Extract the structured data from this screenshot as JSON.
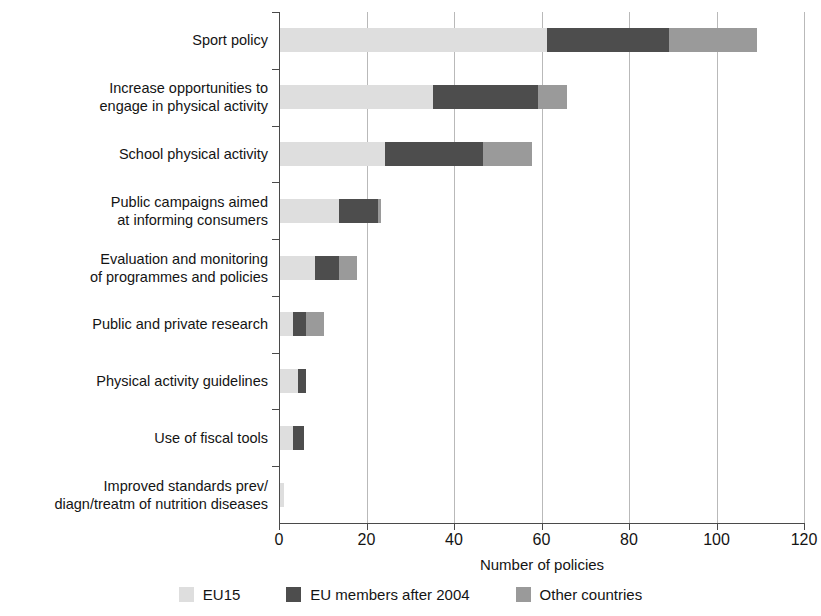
{
  "chart_data": {
    "type": "bar",
    "orientation": "horizontal",
    "stacked": true,
    "title": "",
    "xlabel": "Number of policies",
    "ylabel": "",
    "xlim": [
      0,
      120
    ],
    "xticks": [
      0,
      20,
      40,
      60,
      80,
      100,
      120
    ],
    "grid": "vertical",
    "legend_position": "bottom",
    "categories": [
      "Sport policy",
      "Increase opportunities to\nengage in physical activity",
      "School physical activity",
      "Public campaigns aimed\nat informing consumers",
      "Evaluation and monitoring\nof programmes and policies",
      "Public and private research",
      "Physical activity guidelines",
      "Use of fiscal tools",
      "Improved standards prev/\ndiagn/treatm of nutrition diseases"
    ],
    "series": [
      {
        "name": "EU15",
        "color": "#dedede",
        "values": [
          61,
          35,
          24,
          13.5,
          8,
          3,
          4,
          3,
          1
        ]
      },
      {
        "name": "EU members after 2004",
        "color": "#4d4d4d",
        "values": [
          28,
          24,
          22.5,
          9,
          5.5,
          3,
          2,
          2.5,
          0
        ]
      },
      {
        "name": "Other countries",
        "color": "#9a9a9a",
        "values": [
          20,
          6.5,
          11,
          0.5,
          4,
          4,
          0,
          0,
          0
        ]
      }
    ],
    "totals": [
      109,
      65.5,
      57.5,
      23,
      17.5,
      10,
      6,
      5.5,
      1
    ]
  },
  "legend": {
    "items": [
      {
        "label": "EU15",
        "swatch": "legend-swatch-eu15"
      },
      {
        "label": "EU members after 2004",
        "swatch": "legend-swatch-after-2004"
      },
      {
        "label": "Other countries",
        "swatch": "legend-swatch-other-countries"
      }
    ]
  }
}
